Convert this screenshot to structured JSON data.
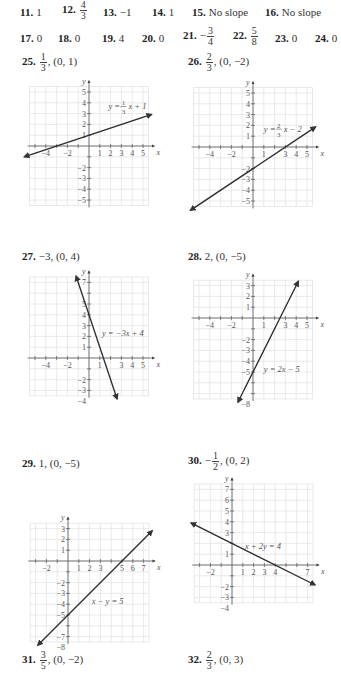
{
  "answers_row1": [
    {
      "num": "11.",
      "value": "1"
    },
    {
      "num": "12.",
      "frac_num": "4",
      "frac_den": "3"
    },
    {
      "num": "13.",
      "value": "−1"
    },
    {
      "num": "14.",
      "value": "1"
    },
    {
      "num": "15.",
      "value": "No slope"
    },
    {
      "num": "16.",
      "value": "No slope"
    }
  ],
  "answers_row2": [
    {
      "num": "17.",
      "value": "0"
    },
    {
      "num": "18.",
      "value": "0"
    },
    {
      "num": "19.",
      "value": "4"
    },
    {
      "num": "20.",
      "value": "0"
    },
    {
      "num": "21.",
      "sign": "−",
      "frac_num": "3",
      "frac_den": "4"
    },
    {
      "num": "22.",
      "frac_num": "5",
      "frac_den": "8"
    },
    {
      "num": "23.",
      "value": "0"
    },
    {
      "num": "24.",
      "value": "0"
    }
  ],
  "problems": [
    {
      "num": "25.",
      "slope_sign": "",
      "slope_num": "1",
      "slope_den": "3",
      "intercept": ", (0, 1)",
      "equation": "y = ",
      "eq_frac_num": "1",
      "eq_frac_den": "3",
      "eq_rest": "x + 1"
    },
    {
      "num": "26.",
      "slope_sign": "",
      "slope_num": "2",
      "slope_den": "3",
      "intercept": ", (0, −2)",
      "equation": "y = ",
      "eq_frac_num": "2",
      "eq_frac_den": "3",
      "eq_rest": "x − 2"
    },
    {
      "num": "27.",
      "slope_text": "−3, (0, 4)",
      "equation": "y = −3x + 4"
    },
    {
      "num": "28.",
      "slope_text": "2, (0, −5)",
      "equation": "y = 2x − 5"
    },
    {
      "num": "29.",
      "slope_text": "1, (0, −5)",
      "equation": "x − y = 5"
    },
    {
      "num": "30.",
      "slope_sign": "−",
      "slope_num": "1",
      "slope_den": "2",
      "intercept": ", (0, 2)",
      "equation": "x + 2y = 4"
    },
    {
      "num": "31.",
      "slope_sign": "",
      "slope_num": "3",
      "slope_den": "5",
      "intercept": ", (0, −2)"
    },
    {
      "num": "32.",
      "slope_sign": "",
      "slope_num": "2",
      "slope_den": "3",
      "intercept": ", (0, 3)"
    }
  ],
  "axis_labels": {
    "x": "x",
    "y": "y"
  },
  "graphs": {
    "g25": {
      "xticks": [
        "−4",
        "−2",
        "1",
        "2",
        "3",
        "4",
        "5"
      ],
      "yticks": [
        "5",
        "4",
        "3",
        "2",
        "1",
        "−2",
        "−3",
        "−4",
        "−5"
      ]
    },
    "g26": {
      "xticks": [
        "−4",
        "−2",
        "1",
        "3",
        "4",
        "5"
      ],
      "yticks": [
        "5",
        "4",
        "3",
        "2",
        "1",
        "−2",
        "−3",
        "−4",
        "−5"
      ]
    },
    "g27": {
      "xticks": [
        "−4",
        "−2",
        "1",
        "3",
        "4",
        "5"
      ],
      "yticks": [
        "7",
        "5",
        "4",
        "3",
        "2",
        "1",
        "−2",
        "−3",
        "−4"
      ]
    },
    "g28": {
      "xticks": [
        "−4",
        "−2",
        "1",
        "3",
        "4",
        "5"
      ],
      "yticks": [
        "3",
        "2",
        "1",
        "−2",
        "−3",
        "−4",
        "−5",
        "−8"
      ]
    },
    "g29": {
      "xticks": [
        "−2",
        "1",
        "2",
        "3",
        "5",
        "6",
        "7"
      ],
      "yticks": [
        "3",
        "2",
        "1",
        "−2",
        "−3",
        "−4",
        "−5",
        "−7",
        "−8"
      ]
    },
    "g30": {
      "xticks": [
        "−2",
        "1",
        "2",
        "3",
        "4",
        "7"
      ],
      "yticks": [
        "7",
        "6",
        "5",
        "4",
        "3",
        "1",
        "−2",
        "−3",
        "−4"
      ]
    }
  }
}
